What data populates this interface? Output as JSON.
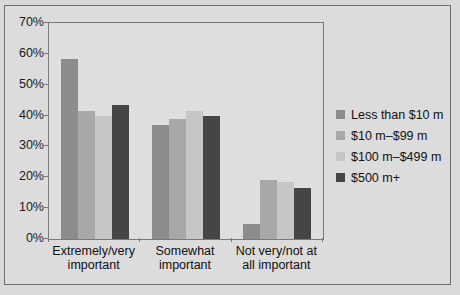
{
  "chart_data": {
    "type": "bar",
    "title": "",
    "subtitle": "",
    "xlabel": "",
    "ylabel": "",
    "ylim": [
      0,
      70
    ],
    "grid": false,
    "legend_position": "right",
    "categories": [
      "Extremely/very important",
      "Somewhat important",
      "Not very/not at all important"
    ],
    "ytick_labels": [
      "70%",
      "60%",
      "50%",
      "40%",
      "30%",
      "20%",
      "10%",
      "0%"
    ],
    "ytick_values": [
      70,
      60,
      50,
      40,
      30,
      20,
      10,
      0
    ],
    "series": [
      {
        "name": "Less than $10 m",
        "color": "#8c8c8c",
        "values": [
          58.5,
          37,
          5
        ]
      },
      {
        "name": "$10 m–$99 m",
        "color": "#a8a8a8",
        "values": [
          41.5,
          39,
          19
        ]
      },
      {
        "name": "$100 m–$499 m",
        "color": "#c6c6c6",
        "values": [
          40,
          41.5,
          18.5
        ]
      },
      {
        "name": "$500 m+",
        "color": "#454545",
        "values": [
          43.5,
          40,
          16.5
        ]
      }
    ]
  },
  "categories_wrapped": [
    [
      "Extremely/very",
      "important"
    ],
    [
      "Somewhat",
      "important"
    ],
    [
      "Not very/not at",
      "all important"
    ]
  ],
  "colors": {
    "background": "#d9d9d9",
    "plot_background": "#dedede",
    "axis": "#7a7a7a",
    "frame": "#6e6e6e",
    "text": "#111111"
  }
}
